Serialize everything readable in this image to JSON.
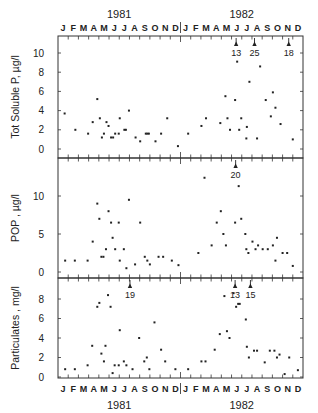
{
  "chart_data": [
    {
      "type": "scatter",
      "panel": "top",
      "ylabel": "Tot Soluble P,  µg/l",
      "yticks": [
        0,
        2,
        4,
        6,
        8,
        10
      ],
      "ylim": [
        -0.8,
        11.5
      ],
      "xlabel_top_years": [
        "1981",
        "1982"
      ],
      "months": [
        "J",
        "F",
        "M",
        "A",
        "M",
        "J",
        "J",
        "A",
        "S",
        "O",
        "N",
        "D",
        "J",
        "F",
        "M",
        "A",
        "M",
        "J",
        "J",
        "A",
        "S",
        "O",
        "N",
        "D"
      ],
      "x_unit": "months since Jan 1981",
      "annotations": [
        {
          "x": 17.45,
          "label": "13",
          "note": "off-scale value (arrow)"
        },
        {
          "x": 19.25,
          "label": "25",
          "note": "off-scale value (arrow)"
        },
        {
          "x": 22.6,
          "label": "18",
          "note": "off-scale value (arrow)"
        }
      ],
      "points": [
        [
          0.65,
          3.7
        ],
        [
          1.7,
          2.0
        ],
        [
          2.95,
          1.6
        ],
        [
          3.4,
          2.8
        ],
        [
          3.85,
          5.2
        ],
        [
          4.1,
          3.2
        ],
        [
          4.3,
          1.2
        ],
        [
          4.5,
          1.6
        ],
        [
          4.75,
          2.8
        ],
        [
          4.95,
          2.4
        ],
        [
          5.2,
          1.2
        ],
        [
          5.4,
          1.2
        ],
        [
          5.6,
          1.6
        ],
        [
          5.95,
          1.6
        ],
        [
          6.05,
          3.2
        ],
        [
          6.5,
          2.0
        ],
        [
          6.65,
          2.0
        ],
        [
          6.95,
          4.0
        ],
        [
          7.6,
          1.2
        ],
        [
          8.05,
          0.8
        ],
        [
          8.6,
          1.6
        ],
        [
          8.75,
          1.6
        ],
        [
          8.9,
          1.6
        ],
        [
          9.55,
          0.8
        ],
        [
          10.1,
          1.6
        ],
        [
          10.7,
          3.2
        ],
        [
          11.75,
          0.3
        ],
        [
          12.75,
          1.6
        ],
        [
          14.05,
          2.4
        ],
        [
          14.5,
          3.2
        ],
        [
          15.9,
          2.7
        ],
        [
          16.4,
          5.5
        ],
        [
          16.6,
          3.2
        ],
        [
          16.85,
          2.0
        ],
        [
          17.35,
          5.1
        ],
        [
          17.55,
          9.1
        ],
        [
          17.75,
          2.0
        ],
        [
          17.95,
          3.2
        ],
        [
          18.45,
          1.1
        ],
        [
          18.5,
          2.3
        ],
        [
          18.75,
          7.0
        ],
        [
          19.5,
          1.1
        ],
        [
          19.8,
          8.6
        ],
        [
          20.35,
          5.1
        ],
        [
          20.85,
          3.4
        ],
        [
          21.05,
          5.9
        ],
        [
          21.3,
          4.3
        ],
        [
          21.8,
          2.6
        ],
        [
          23.0,
          1.0
        ]
      ]
    },
    {
      "type": "scatter",
      "panel": "middle",
      "ylabel": "POP ,  µg/l",
      "yticks": [
        0,
        5,
        10
      ],
      "ylim": [
        -0.8,
        14.5
      ],
      "annotations": [
        {
          "x": 17.4,
          "label": "20",
          "note": "off-scale value (arrow)"
        }
      ],
      "points": [
        [
          0.7,
          1.5
        ],
        [
          1.65,
          1.5
        ],
        [
          2.9,
          1.5
        ],
        [
          3.4,
          4.0
        ],
        [
          3.85,
          9.0
        ],
        [
          4.05,
          7.0
        ],
        [
          4.25,
          2.0
        ],
        [
          4.45,
          2.0
        ],
        [
          4.7,
          3.0
        ],
        [
          4.95,
          8.0
        ],
        [
          5.2,
          6.5
        ],
        [
          5.35,
          4.5
        ],
        [
          5.6,
          3.0
        ],
        [
          5.95,
          6.5
        ],
        [
          6.05,
          1.5
        ],
        [
          6.45,
          3.0
        ],
        [
          6.7,
          0.5
        ],
        [
          6.95,
          9.5
        ],
        [
          7.55,
          1.0
        ],
        [
          8.05,
          6.5
        ],
        [
          8.5,
          2.0
        ],
        [
          8.75,
          1.5
        ],
        [
          9.0,
          1.0
        ],
        [
          9.85,
          2.0
        ],
        [
          10.3,
          2.0
        ],
        [
          11.15,
          1.5
        ],
        [
          11.8,
          0.9
        ],
        [
          13.75,
          2.5
        ],
        [
          14.35,
          12.4
        ],
        [
          15.05,
          3.5
        ],
        [
          15.55,
          6.5
        ],
        [
          15.95,
          8.0
        ],
        [
          16.2,
          5.0
        ],
        [
          16.45,
          3.5
        ],
        [
          17.35,
          6.5
        ],
        [
          17.7,
          11.3
        ],
        [
          17.95,
          7.0
        ],
        [
          18.35,
          5.0
        ],
        [
          18.45,
          3.0
        ],
        [
          18.65,
          2.5
        ],
        [
          19.05,
          4.0
        ],
        [
          19.35,
          3.0
        ],
        [
          19.6,
          3.5
        ],
        [
          20.05,
          3.0
        ],
        [
          20.55,
          3.0
        ],
        [
          21.05,
          3.5
        ],
        [
          21.3,
          1.5
        ],
        [
          21.45,
          4.5
        ],
        [
          22.0,
          2.5
        ],
        [
          22.45,
          2.5
        ],
        [
          23.0,
          0.8
        ]
      ]
    },
    {
      "type": "scatter",
      "panel": "bottom",
      "ylabel": "Particulates , mg/l",
      "yticks": [
        0,
        2,
        4,
        6,
        8
      ],
      "ylim": [
        -0.1,
        9.6
      ],
      "xlabel_bottom_years": [
        "1981",
        "1982"
      ],
      "annotations": [
        {
          "x": 7.05,
          "label": "19",
          "note": "off-scale value (arrow)"
        },
        {
          "x": 17.35,
          "label": "13",
          "note": "off-scale value (arrow)"
        },
        {
          "x": 18.85,
          "label": "15",
          "note": "off-scale value (arrow)"
        }
      ],
      "points": [
        [
          0.7,
          0.8
        ],
        [
          1.65,
          0.8
        ],
        [
          2.9,
          1.2
        ],
        [
          3.35,
          3.2
        ],
        [
          3.85,
          7.2
        ],
        [
          4.05,
          7.6
        ],
        [
          4.25,
          2.4
        ],
        [
          4.5,
          1.6
        ],
        [
          4.65,
          3.2
        ],
        [
          4.9,
          8.4
        ],
        [
          5.15,
          7.2
        ],
        [
          5.35,
          0.4
        ],
        [
          5.55,
          1.2
        ],
        [
          5.95,
          1.2
        ],
        [
          6.05,
          4.8
        ],
        [
          6.45,
          1.6
        ],
        [
          6.7,
          1.2
        ],
        [
          7.3,
          0.8
        ],
        [
          7.95,
          4.0
        ],
        [
          8.45,
          1.6
        ],
        [
          8.7,
          2.0
        ],
        [
          8.95,
          0.8
        ],
        [
          9.45,
          5.6
        ],
        [
          10.1,
          2.8
        ],
        [
          10.5,
          1.6
        ],
        [
          11.5,
          0.8
        ],
        [
          12.75,
          0.8
        ],
        [
          14.05,
          1.6
        ],
        [
          14.45,
          1.6
        ],
        [
          15.35,
          2.8
        ],
        [
          15.85,
          4.4
        ],
        [
          16.3,
          8.3
        ],
        [
          16.55,
          4.7
        ],
        [
          16.8,
          4.0
        ],
        [
          17.2,
          8.6
        ],
        [
          17.45,
          7.2
        ],
        [
          17.65,
          7.5
        ],
        [
          17.8,
          7.5
        ],
        [
          18.4,
          5.9
        ],
        [
          18.5,
          3.1
        ],
        [
          18.7,
          2.0
        ],
        [
          19.2,
          2.7
        ],
        [
          19.5,
          2.7
        ],
        [
          20.25,
          1.5
        ],
        [
          20.75,
          2.7
        ],
        [
          21.2,
          2.7
        ],
        [
          21.45,
          2.0
        ],
        [
          21.7,
          2.3
        ],
        [
          22.2,
          0.3
        ],
        [
          22.65,
          2.0
        ],
        [
          23.5,
          0.7
        ]
      ]
    }
  ],
  "layout": {
    "plot_left_px": 58,
    "plot_right_px": 303,
    "panels_px": [
      {
        "top": 36,
        "bottom": 158,
        "zero_y": 149,
        "px_per_unit": 9.6
      },
      {
        "top": 158,
        "bottom": 278,
        "zero_y": 272,
        "px_per_unit": 7.6
      },
      {
        "top": 278,
        "bottom": 378,
        "zero_y": 377,
        "px_per_unit": 9.75
      }
    ]
  },
  "labels": {
    "year_1981": "1981",
    "year_1982": "1982"
  }
}
